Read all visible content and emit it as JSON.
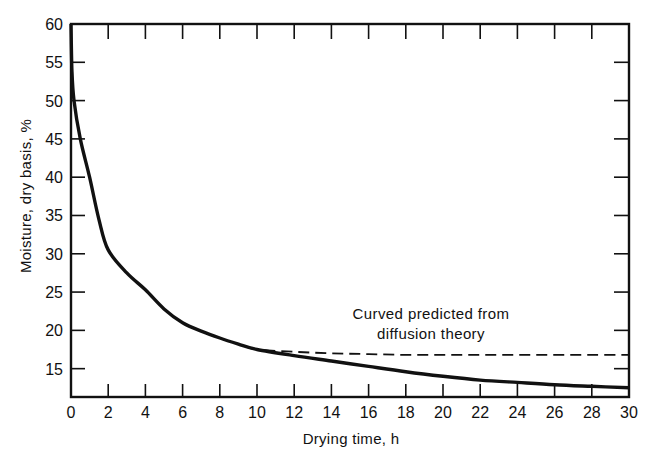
{
  "chart_data": {
    "type": "line",
    "title": "",
    "xlabel": "Drying time, h",
    "ylabel": "Moisture, dry basis, %",
    "xlim": [
      0,
      30
    ],
    "ylim": [
      11.3,
      60
    ],
    "x_ticks": [
      0,
      2,
      4,
      6,
      8,
      10,
      12,
      14,
      16,
      18,
      20,
      22,
      24,
      26,
      28,
      30
    ],
    "y_ticks": [
      15,
      20,
      25,
      30,
      35,
      40,
      45,
      50,
      55,
      60
    ],
    "grid": false,
    "legend": null,
    "series": [
      {
        "name": "Experimental drying curve",
        "style": "solid",
        "x": [
          0,
          0.05,
          0.16,
          0.5,
          1.0,
          1.5,
          2,
          3,
          4,
          5,
          6,
          7,
          8,
          9,
          10,
          12,
          14,
          16,
          18,
          20,
          22,
          24,
          26,
          28,
          30
        ],
        "y": [
          60,
          54,
          50,
          45,
          40,
          34.5,
          30.5,
          27.5,
          25.3,
          22.8,
          21.0,
          19.9,
          19.0,
          18.2,
          17.5,
          16.7,
          16.0,
          15.3,
          14.6,
          14.0,
          13.5,
          13.2,
          12.9,
          12.7,
          12.5
        ]
      },
      {
        "name": "Curved predicted from diffusion theory",
        "style": "dashed",
        "x": [
          9.5,
          10,
          12,
          14,
          16,
          18,
          20,
          22,
          24,
          26,
          28,
          30
        ],
        "y": [
          17.8,
          17.5,
          17.2,
          17.0,
          16.9,
          16.8,
          16.8,
          16.8,
          16.8,
          16.8,
          16.8,
          16.8
        ]
      }
    ],
    "annotations": [
      {
        "text_line1": "Curved predicted from",
        "text_line2": "diffusion theory",
        "x": 21.5,
        "y": 18.5
      }
    ]
  },
  "labels": {
    "xlabel": "Drying time, h",
    "ylabel": "Moisture, dry basis, %",
    "annotation_line1": "Curved predicted from",
    "annotation_line2": "diffusion theory"
  },
  "colors": {
    "line": "#111111",
    "background": "#ffffff"
  }
}
